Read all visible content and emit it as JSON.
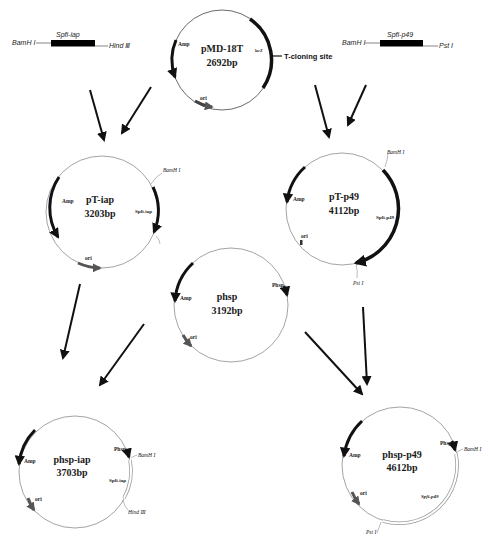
{
  "diagram": {
    "type": "plasmid-construction-flowchart",
    "vector": {
      "name": "pMD-18T",
      "size": "2692bp",
      "features": [
        "Amp",
        "ori",
        "lacZ"
      ],
      "annotation": "T-cloning site"
    },
    "inserts": [
      {
        "name": "Spfi-iap",
        "left_site": "BamH I",
        "right_site": "Hind Ⅲ"
      },
      {
        "name": "Spfi-p49",
        "left_site": "BamH I",
        "right_site": "Pst I"
      }
    ],
    "plasmids": {
      "pT_iap": {
        "name": "pT-iap",
        "size": "3203bp",
        "amp": "Amp",
        "ori": "ori",
        "insert": "Spfi-iap",
        "site1": "BamH I"
      },
      "pT_p49": {
        "name": "pT-p49",
        "size": "4112bp",
        "amp": "Amp",
        "ori": "ori",
        "insert": "Spfi-p49",
        "site1": "BamH I",
        "site2": "Pst I"
      },
      "phsp": {
        "name": "phsp",
        "size": "3192bp",
        "amp": "Amp",
        "ori": "ori",
        "promoter": "Phsp"
      },
      "phsp_iap": {
        "name": "phsp-iap",
        "size": "3703bp",
        "amp": "Amp",
        "ori": "ori",
        "promoter": "Phsp",
        "insert": "Spfi-iap",
        "site1": "BamH I",
        "site2": "Hind Ⅲ"
      },
      "phsp_p49": {
        "name": "phsp-p49",
        "size": "4612bp",
        "amp": "Amp",
        "ori": "ori",
        "promoter": "Phsp",
        "insert": "Spfi-p49",
        "site1": "BamH I",
        "site2": "Pst I"
      }
    },
    "flows": [
      {
        "from": "Spfi-iap",
        "to": "pT-iap"
      },
      {
        "from": "pMD-18T",
        "to": "pT-iap"
      },
      {
        "from": "pMD-18T",
        "to": "pT-p49"
      },
      {
        "from": "Spfi-p49",
        "to": "pT-p49"
      },
      {
        "from": "pT-iap",
        "to": "phsp-iap"
      },
      {
        "from": "phsp",
        "to": "phsp-iap"
      },
      {
        "from": "phsp",
        "to": "phsp-p49"
      },
      {
        "from": "pT-p49",
        "to": "phsp-p49"
      }
    ],
    "colors": {
      "line": "#111111",
      "backbone": "#666666",
      "ori": "#555555",
      "insert_hollow": "#bbbbbb"
    }
  }
}
